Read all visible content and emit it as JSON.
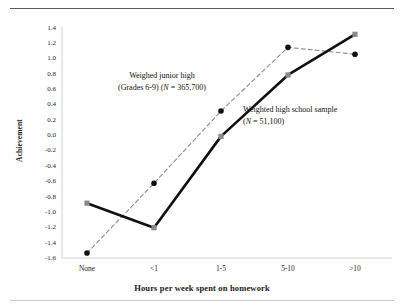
{
  "chart_data": {
    "type": "line",
    "title": "",
    "xlabel": "Hours per week spent on homework",
    "ylabel": "Achievement",
    "categories": [
      "None",
      "<1",
      "1-5",
      "5-10",
      ">10"
    ],
    "ylim": [
      -1.6,
      1.4
    ],
    "ytick_step": 0.2,
    "yticks": [
      "1.4",
      "1.2",
      "1.0",
      "0.8",
      "0.6",
      "0.4",
      "0.2",
      "0.0",
      "-0.2",
      "-0.4",
      "-0.6",
      "-0.8",
      "-1.0",
      "-1.2",
      "-1.4",
      "-1.6"
    ],
    "grid": false,
    "legend_position": "annotations-inline",
    "series": [
      {
        "name": "Weighed junior high (Grades 6-9) (N = 365,700)",
        "style": "dashed",
        "color": "#8c8c8c",
        "marker": "circle",
        "marker_color": "#101010",
        "values": [
          -1.55,
          -0.64,
          0.3,
          1.13,
          1.04
        ]
      },
      {
        "name": "Weighted high school sample (N = 51,100)",
        "style": "solid",
        "color": "#101010",
        "marker": "square",
        "marker_color": "#8a8a8a",
        "values": [
          -0.9,
          -1.22,
          -0.03,
          0.77,
          1.3
        ]
      }
    ],
    "annotations": [
      {
        "id": "junior",
        "line1": "Weighed junior high",
        "line2_pre": "(Grades 6-9) (",
        "line2_italic": "N",
        "line2_post": " = 365,700)"
      },
      {
        "id": "high",
        "line1": "Weighted high school sample",
        "line2_pre": "(",
        "line2_italic": "N",
        "line2_post": " = 51,100)"
      }
    ]
  }
}
